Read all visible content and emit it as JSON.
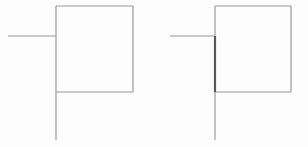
{
  "figure": {
    "canvas": {
      "width": 308,
      "height": 147,
      "background": "#fdfdfd"
    },
    "stroke_colors": {
      "normal": "#9a9a9a",
      "highlight": "#5a5a5a"
    },
    "stroke_widths": {
      "normal": 1.2,
      "highlight": 2.2
    },
    "panels": [
      {
        "id": "panel-left",
        "label": "Left diagram",
        "highlighted": false,
        "square": {
          "x": 56,
          "y": 6,
          "width": 77,
          "height": 86
        },
        "vertical_line": {
          "x": 56,
          "y_top": 6,
          "y_bottom": 140
        },
        "horizontal_line": {
          "y": 36,
          "x_start": 8,
          "x_end": 56
        },
        "junction": {
          "x": 56,
          "y": 36
        },
        "highlight_segment": null
      },
      {
        "id": "panel-right",
        "label": "Right diagram",
        "highlighted": true,
        "square": {
          "x": 215,
          "y": 6,
          "width": 76,
          "height": 86
        },
        "vertical_line": {
          "x": 215,
          "y_top": 6,
          "y_bottom": 140
        },
        "horizontal_line": {
          "y": 36,
          "x_start": 170,
          "x_end": 215
        },
        "junction": {
          "x": 215,
          "y": 36
        },
        "highlight_segment": {
          "x": 215,
          "y_top": 36,
          "y_bottom": 92
        }
      }
    ]
  }
}
